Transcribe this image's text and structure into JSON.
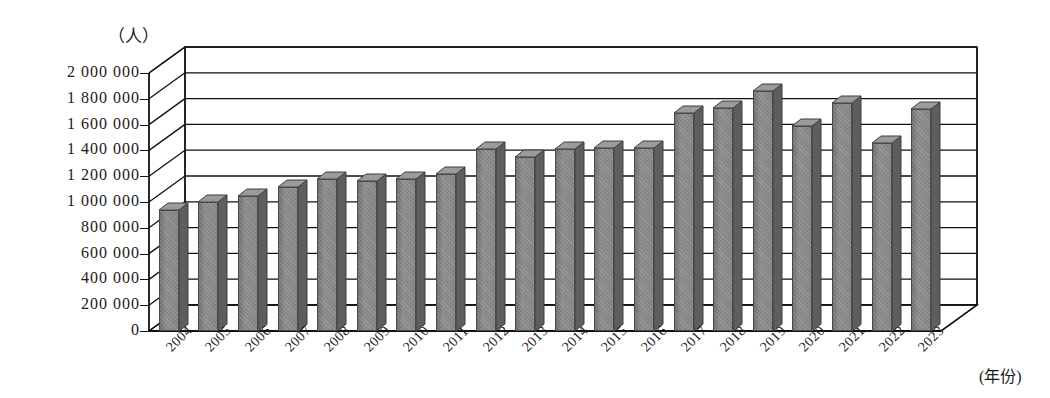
{
  "chart_data": {
    "type": "bar",
    "title": "",
    "subtitle": "",
    "xlabel": "(年份)",
    "ylabel": "（人）",
    "unit_caption": "（人）",
    "grid": true,
    "legend": null,
    "three_d": true,
    "ylim": [
      0,
      2000000
    ],
    "ytick_step": 200000,
    "ytick_labels": [
      "2 000 000",
      "1 800 000",
      "1 600 000",
      "1 400 000",
      "1 200 000",
      "1 000 000",
      "800 000",
      "600 000",
      "400 000",
      "200 000",
      "0"
    ],
    "ytick_values": [
      2000000,
      1800000,
      1600000,
      1400000,
      1200000,
      1000000,
      800000,
      600000,
      400000,
      200000,
      0
    ],
    "categories": [
      "2004",
      "2005",
      "2006",
      "2007",
      "2008",
      "2009",
      "2010",
      "2011",
      "2012",
      "2013",
      "2014",
      "2015",
      "2016",
      "2017",
      "2018",
      "2019",
      "2020",
      "2021",
      "2022",
      "2023"
    ],
    "values": [
      940000,
      1000000,
      1050000,
      1120000,
      1180000,
      1160000,
      1180000,
      1220000,
      1410000,
      1350000,
      1410000,
      1420000,
      1420000,
      1690000,
      1730000,
      1860000,
      1590000,
      1770000,
      1460000,
      1720000
    ],
    "series": [
      {
        "name": "",
        "values": [
          940000,
          1000000,
          1050000,
          1120000,
          1180000,
          1160000,
          1180000,
          1220000,
          1410000,
          1350000,
          1410000,
          1420000,
          1420000,
          1690000,
          1730000,
          1860000,
          1590000,
          1770000,
          1460000,
          1720000
        ]
      }
    ],
    "bar_color": "#7d7d7d",
    "bar_top_color": "#9b9b9b",
    "bar_side_color": "#5e5e5e",
    "axis_color": "#111111",
    "background_color": "#ffffff"
  }
}
